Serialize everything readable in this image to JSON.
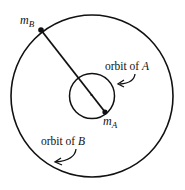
{
  "diagram": {
    "type": "two-body orbit",
    "labels": {
      "mass_b": {
        "base": "m",
        "sub": "B"
      },
      "mass_a": {
        "base": "m",
        "sub": "A"
      },
      "orbit_a": {
        "text": "orbit of ",
        "var": "A"
      },
      "orbit_b": {
        "text": "orbit of ",
        "var": "B"
      }
    },
    "colors": {
      "stroke": "#111111",
      "background": "#ffffff"
    }
  }
}
